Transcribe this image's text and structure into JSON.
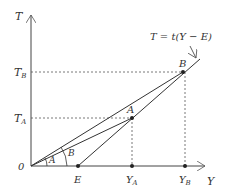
{
  "diagram": {
    "axes": {
      "y_axis_label": "T",
      "x_axis_label": "Y",
      "origin_label": "0"
    },
    "tick_labels": {
      "t_b": "T",
      "t_b_sub": "B",
      "t_a": "T",
      "t_a_sub": "A",
      "e": "E",
      "y_a": "Y",
      "y_a_sub": "A",
      "y_b": "Y",
      "y_b_sub": "B"
    },
    "points": {
      "a": "A",
      "b": "B"
    },
    "angles": {
      "angle_a": "A",
      "angle_b": "B"
    },
    "equation": "T = t(Y − E)",
    "colors": {
      "line": "#333333",
      "dashed": "#555555"
    }
  }
}
